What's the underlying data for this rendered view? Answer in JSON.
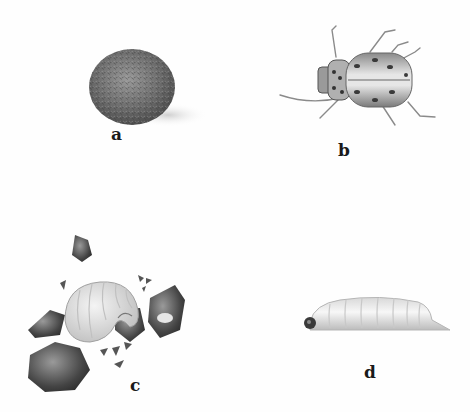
{
  "plate": {
    "background": "#fefefe",
    "figures": [
      {
        "id": "a",
        "label": "a",
        "subject": "egg-mass"
      },
      {
        "id": "b",
        "label": "b",
        "subject": "adult-beetle"
      },
      {
        "id": "c",
        "label": "c",
        "subject": "curled-grub-in-soil-cell"
      },
      {
        "id": "d",
        "label": "d",
        "subject": "larva-side-view"
      }
    ]
  }
}
